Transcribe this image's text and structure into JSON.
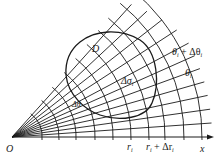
{
  "diagram": {
    "origin": {
      "label": "O",
      "x": 12,
      "y": 137
    },
    "x_axis": {
      "label": "x",
      "end_x": 212
    },
    "region_label": "D",
    "cell_label": "Δσ",
    "cell_label_subscript": "i",
    "angle_label": "Δθ",
    "ray_labels": [
      {
        "text": "θ",
        "sub": "i",
        "suffix": ""
      },
      {
        "text": "θ",
        "sub": "i",
        "suffix": " + Δθ",
        "suffix_sub": "i"
      }
    ],
    "radius_labels": [
      {
        "text": "r",
        "sub": "i",
        "suffix": ""
      },
      {
        "text": "r",
        "sub": "i",
        "suffix": " + Δr",
        "suffix_sub": "i"
      }
    ],
    "ray_angles_deg": [
      0,
      4,
      8,
      12,
      16,
      20,
      24,
      28,
      33,
      38,
      43,
      48
    ],
    "arc_radii": [
      30,
      47,
      64,
      83,
      101,
      119,
      137,
      153,
      172,
      190
    ],
    "colors": {
      "stroke": "#1a1a1a",
      "background": "#ffffff"
    }
  }
}
